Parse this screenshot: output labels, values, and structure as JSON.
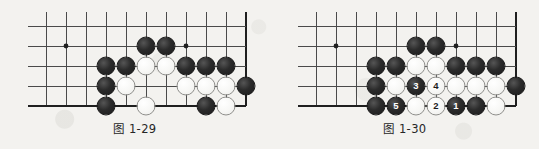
{
  "page": {
    "background_color": "#f3f2ef",
    "width": 539,
    "height": 149,
    "content_type": "go-board-diagram-pair"
  },
  "style": {
    "black_stone_color": "#242424",
    "white_stone_color": "#f7f7f5",
    "white_stone_border": "#8f8f8c",
    "grid_line_color": "#4a4a4a",
    "board_edge_color": "#1f1f1f",
    "caption_color": "#262626"
  },
  "figures": [
    {
      "id": "figure-left",
      "caption": "图 1-29",
      "caption_label": "图",
      "caption_number": "1-29",
      "origin_x": 0,
      "board": {
        "columns_x": [
          46,
          66,
          86,
          106,
          126,
          146,
          166,
          186,
          206,
          226
        ],
        "rows_y": [
          26,
          46,
          66,
          86,
          106
        ],
        "right_edge_x": 246,
        "bottom_edge_y": 106,
        "star_points": [
          [
            66,
            46
          ],
          [
            186,
            46
          ]
        ],
        "edge_note": "right and bottom are board edges (thick lines)"
      },
      "stones": [
        {
          "x": 146,
          "y": 46,
          "color": "black",
          "label": ""
        },
        {
          "x": 166,
          "y": 46,
          "color": "black",
          "label": ""
        },
        {
          "x": 106,
          "y": 66,
          "color": "black",
          "label": ""
        },
        {
          "x": 126,
          "y": 66,
          "color": "black",
          "label": ""
        },
        {
          "x": 146,
          "y": 66,
          "color": "white",
          "label": ""
        },
        {
          "x": 166,
          "y": 66,
          "color": "white",
          "label": ""
        },
        {
          "x": 186,
          "y": 66,
          "color": "black",
          "label": ""
        },
        {
          "x": 206,
          "y": 66,
          "color": "black",
          "label": ""
        },
        {
          "x": 226,
          "y": 66,
          "color": "black",
          "label": ""
        },
        {
          "x": 106,
          "y": 86,
          "color": "black",
          "label": ""
        },
        {
          "x": 126,
          "y": 86,
          "color": "white",
          "label": ""
        },
        {
          "x": 186,
          "y": 86,
          "color": "white",
          "label": ""
        },
        {
          "x": 206,
          "y": 86,
          "color": "white",
          "label": ""
        },
        {
          "x": 226,
          "y": 86,
          "color": "white",
          "label": ""
        },
        {
          "x": 246,
          "y": 86,
          "color": "black",
          "label": ""
        },
        {
          "x": 106,
          "y": 106,
          "color": "black",
          "label": ""
        },
        {
          "x": 146,
          "y": 106,
          "color": "white",
          "label": ""
        },
        {
          "x": 206,
          "y": 106,
          "color": "black",
          "label": ""
        },
        {
          "x": 226,
          "y": 106,
          "color": "white",
          "label": ""
        }
      ]
    },
    {
      "id": "figure-right",
      "caption": "图 1-30",
      "caption_label": "图",
      "caption_number": "1-30",
      "origin_x": 270,
      "board": {
        "columns_x": [
          46,
          66,
          86,
          106,
          126,
          146,
          166,
          186,
          206,
          226
        ],
        "rows_y": [
          26,
          46,
          66,
          86,
          106
        ],
        "right_edge_x": 246,
        "bottom_edge_y": 106,
        "star_points": [
          [
            66,
            46
          ],
          [
            186,
            46
          ]
        ],
        "edge_note": "right and bottom are board edges (thick lines)"
      },
      "stones": [
        {
          "x": 146,
          "y": 46,
          "color": "black",
          "label": ""
        },
        {
          "x": 166,
          "y": 46,
          "color": "black",
          "label": ""
        },
        {
          "x": 106,
          "y": 66,
          "color": "black",
          "label": ""
        },
        {
          "x": 126,
          "y": 66,
          "color": "black",
          "label": ""
        },
        {
          "x": 146,
          "y": 66,
          "color": "white",
          "label": ""
        },
        {
          "x": 166,
          "y": 66,
          "color": "white",
          "label": ""
        },
        {
          "x": 186,
          "y": 66,
          "color": "black",
          "label": ""
        },
        {
          "x": 206,
          "y": 66,
          "color": "black",
          "label": ""
        },
        {
          "x": 226,
          "y": 66,
          "color": "black",
          "label": ""
        },
        {
          "x": 106,
          "y": 86,
          "color": "black",
          "label": ""
        },
        {
          "x": 126,
          "y": 86,
          "color": "white",
          "label": ""
        },
        {
          "x": 146,
          "y": 86,
          "color": "black",
          "label": "3"
        },
        {
          "x": 166,
          "y": 86,
          "color": "white",
          "label": "4"
        },
        {
          "x": 186,
          "y": 86,
          "color": "white",
          "label": ""
        },
        {
          "x": 206,
          "y": 86,
          "color": "white",
          "label": ""
        },
        {
          "x": 226,
          "y": 86,
          "color": "white",
          "label": ""
        },
        {
          "x": 246,
          "y": 86,
          "color": "black",
          "label": ""
        },
        {
          "x": 106,
          "y": 106,
          "color": "black",
          "label": ""
        },
        {
          "x": 126,
          "y": 106,
          "color": "black",
          "label": "5"
        },
        {
          "x": 146,
          "y": 106,
          "color": "white",
          "label": ""
        },
        {
          "x": 166,
          "y": 106,
          "color": "white",
          "label": "2"
        },
        {
          "x": 186,
          "y": 106,
          "color": "black",
          "label": "1"
        },
        {
          "x": 206,
          "y": 106,
          "color": "black",
          "label": ""
        },
        {
          "x": 226,
          "y": 106,
          "color": "white",
          "label": ""
        }
      ]
    }
  ]
}
